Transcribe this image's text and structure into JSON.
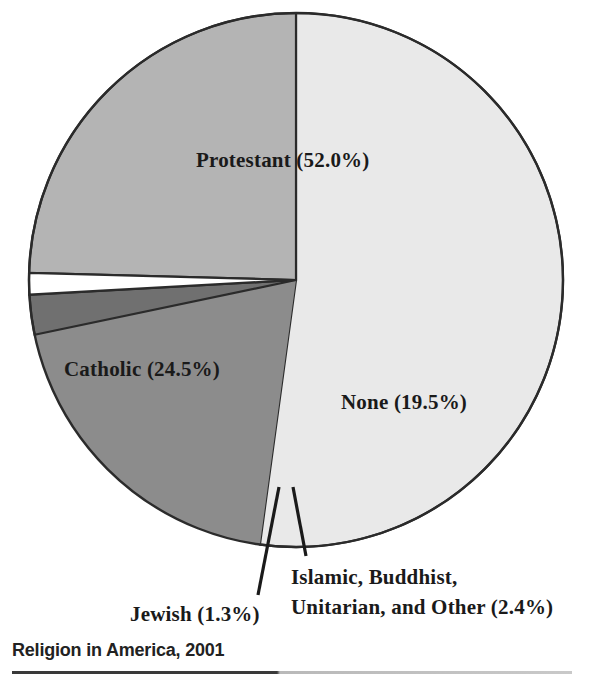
{
  "caption": {
    "title": "Religion in America, 2001"
  },
  "labels": {
    "protestant": "Protestant (52.0%)",
    "catholic": "Catholic (24.5%)",
    "none": "None (19.5%)",
    "jewish": "Jewish (1.3%)",
    "other_line1": "Islamic, Buddhist,",
    "other_line2": "Unitarian, and Other (2.4%)"
  },
  "chart_data": {
    "type": "pie",
    "title": "Religion in America, 2001",
    "categories": [
      "Protestant",
      "None",
      "Islamic, Buddhist, Unitarian, and Other",
      "Jewish",
      "Catholic"
    ],
    "values": [
      52.0,
      19.5,
      2.4,
      1.3,
      24.5
    ],
    "units": "percent",
    "data_labels": [
      "Protestant (52.0%)",
      "None (19.5%)",
      "Islamic, Buddhist, Unitarian, and Other (2.4%)",
      "Jewish (1.3%)",
      "Catholic (24.5%)"
    ],
    "slice_colors": [
      "#e9e9e9",
      "#8c8c8c",
      "#707070",
      "#ffffff",
      "#b4b4b4"
    ],
    "start_angle_deg": 0,
    "direction": "clockwise",
    "legend": "none",
    "grid": false,
    "leader_lines": [
      "Jewish",
      "Islamic, Buddhist, Unitarian, and Other"
    ]
  },
  "colors": {
    "protestant": "#e9e9e9",
    "catholic": "#b4b4b4",
    "none": "#8c8c8c",
    "other": "#707070",
    "jewish": "#ffffff",
    "outline": "#2b2b2b",
    "text": "#1a1a1a",
    "caption_text": "#222222"
  }
}
